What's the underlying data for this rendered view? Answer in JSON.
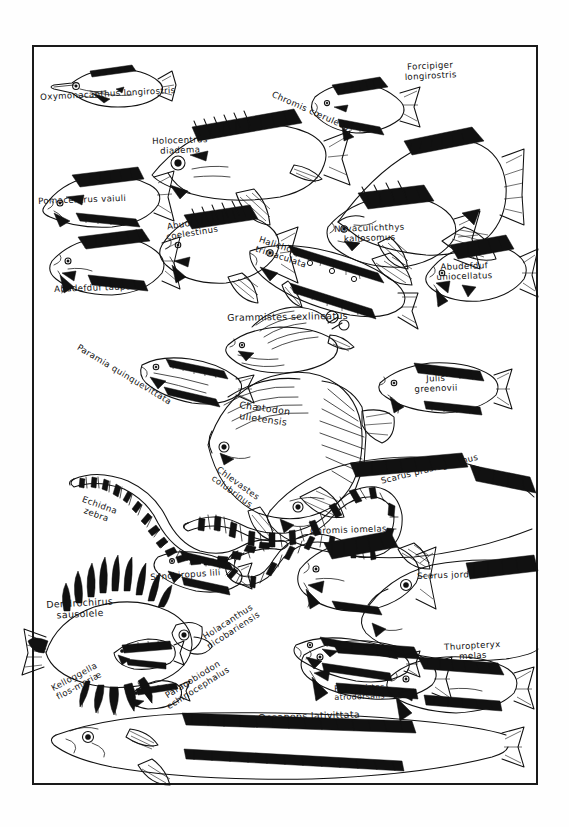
{
  "plate": {
    "title": "Handwritten fish identification plate",
    "style": "pen-and-ink line drawings of 25 reef fish with handwritten Latin binomial labels inside a single ruled rectangular frame",
    "frame": {
      "stroke_color": "#1a1a1a",
      "background": "#ffffff"
    },
    "ink_color": "#111111",
    "paper_color": "#fefefe"
  },
  "species": [
    {
      "id": 1,
      "label": "Oxymonacanthus longirostris",
      "lines": [
        "Oxymonacanthus longirostris"
      ],
      "x": 8,
      "y": 48,
      "rotate": -3,
      "size": "base",
      "icon": "filefish-icon"
    },
    {
      "id": 2,
      "label": "Chromis caeruleus",
      "lines": [
        "Chromis cœruleus"
      ],
      "x": 242,
      "y": 45,
      "rotate": 24,
      "size": "base",
      "icon": "damselfish-icon"
    },
    {
      "id": 3,
      "label": "Forcipiger longirostris",
      "lines": [
        "Forcipiger",
        "longirostris"
      ],
      "x": 372,
      "y": 18,
      "rotate": -3,
      "size": "base",
      "icon": "longnose-butterflyfish-icon"
    },
    {
      "id": 4,
      "label": "Holocentrus diadema",
      "lines": [
        "Holocentrus",
        "diadema"
      ],
      "x": 120,
      "y": 92,
      "rotate": -2,
      "size": "base",
      "icon": "squirrelfish-icon"
    },
    {
      "id": 5,
      "label": "Pomacentrus vaiuli",
      "lines": [
        "Pomacentrus vaiuli"
      ],
      "x": 6,
      "y": 152,
      "rotate": -2,
      "size": "base",
      "icon": "pomacentrus-icon"
    },
    {
      "id": 6,
      "label": "Abudefduf coelestinus",
      "lines": [
        "Abudefduf",
        "coelestinus"
      ],
      "x": 132,
      "y": 178,
      "rotate": -9,
      "size": "base",
      "icon": "sergeant-major-icon"
    },
    {
      "id": 7,
      "label": "Novaculichthys kallosomus",
      "lines": [
        "Novaculichthys",
        "kallosomus"
      ],
      "x": 302,
      "y": 180,
      "rotate": -2,
      "size": "base",
      "icon": "razorfish-icon"
    },
    {
      "id": 8,
      "label": "Halichoeres trimaculata",
      "lines": [
        "Halichœres",
        "trimaculata"
      ],
      "x": 228,
      "y": 190,
      "rotate": 18,
      "size": "base",
      "icon": "wrasse-icon"
    },
    {
      "id": 9,
      "label": "Abudefduf uniocellatus",
      "lines": [
        "Abudefduf",
        "uniocellatus"
      ],
      "x": 404,
      "y": 218,
      "rotate": -2,
      "size": "base",
      "icon": "damsel-uniocellatus-icon"
    },
    {
      "id": 10,
      "label": "Abudefduf taupo",
      "lines": [
        "Abudefduf taupo"
      ],
      "x": 22,
      "y": 240,
      "rotate": -2,
      "size": "base",
      "icon": "abudefduf-taupo-icon"
    },
    {
      "id": 11,
      "label": "Grammistes sexlineatus",
      "lines": [
        "Grammistes sexlineatus"
      ],
      "x": 195,
      "y": 268,
      "rotate": -1,
      "size": "lg",
      "icon": "soapfish-icon"
    },
    {
      "id": 12,
      "label": "Paramia quinquevittata",
      "lines": [
        "Paramia quinquevittata"
      ],
      "x": 48,
      "y": 298,
      "rotate": 31,
      "size": "base",
      "icon": "cardinalfish-icon"
    },
    {
      "id": 13,
      "label": "Julis greenovii",
      "lines": [
        "Julis",
        "greenovii"
      ],
      "x": 382,
      "y": 330,
      "rotate": -2,
      "size": "base",
      "icon": "julis-icon"
    },
    {
      "id": 14,
      "label": "Chaetodon ulietensis",
      "lines": [
        "Chætodon",
        "ulietensis"
      ],
      "x": 208,
      "y": 355,
      "rotate": 8,
      "size": "lg",
      "icon": "butterflyfish-icon"
    },
    {
      "id": 15,
      "label": "Chlevastes colubrinus",
      "lines": [
        "Chlevastes",
        "colubrinus"
      ],
      "x": 188,
      "y": 420,
      "rotate": 36,
      "size": "base",
      "icon": "sea-snake-eel-icon"
    },
    {
      "id": 16,
      "label": "Scarus prasiognathus",
      "lines": [
        "Scarus prasiognathus"
      ],
      "x": 348,
      "y": 432,
      "rotate": -14,
      "size": "base",
      "icon": "parrotfish-icon"
    },
    {
      "id": 17,
      "label": "Echidna zebra",
      "lines": [
        "Echidna",
        "zebra"
      ],
      "x": 52,
      "y": 450,
      "rotate": 20,
      "size": "base",
      "icon": "zebra-moray-icon"
    },
    {
      "id": 18,
      "label": "Chromis iomelas",
      "lines": [
        "Chromis iomelas"
      ],
      "x": 278,
      "y": 482,
      "rotate": -2,
      "size": "base",
      "icon": "chromis-iomelas-icon"
    },
    {
      "id": 19,
      "label": "Synchiropus lili",
      "lines": [
        "Synchiropus lili"
      ],
      "x": 118,
      "y": 528,
      "rotate": -4,
      "size": "base",
      "icon": "dragonet-icon"
    },
    {
      "id": 20,
      "label": "Scarus jordani",
      "lines": [
        "Scarus jordani"
      ],
      "x": 385,
      "y": 527,
      "rotate": -2,
      "size": "base",
      "icon": "scarus-jordani-icon"
    },
    {
      "id": 21,
      "label": "Dendrochirus sausolele",
      "lines": [
        "Dendrochirus",
        "sausolele"
      ],
      "x": 14,
      "y": 555,
      "rotate": -3,
      "size": "lg",
      "icon": "lionfish-icon"
    },
    {
      "id": 22,
      "label": "Holacanthus nicobariensis",
      "lines": [
        "Holacanthus",
        "nicobariensis"
      ],
      "x": 168,
      "y": 590,
      "rotate": -33,
      "size": "base",
      "icon": "angelfish-icon"
    },
    {
      "id": 23,
      "label": "Thuropteryx melas",
      "lines": [
        "Thuropteryx",
        "melas"
      ],
      "x": 412,
      "y": 598,
      "rotate": -3,
      "size": "base",
      "icon": "thuropteryx-icon"
    },
    {
      "id": 24,
      "label": "Petroscirtes atrodorsalis",
      "lines": [
        "Petroscirtes",
        "atrodorsalis"
      ],
      "x": 302,
      "y": 640,
      "rotate": -2,
      "size": "sm",
      "icon": "blenny-icon"
    },
    {
      "id": 25,
      "label": "Kelloggella flos-mariae",
      "lines": [
        "Kelloggella",
        "flos-mariæ"
      ],
      "x": 18,
      "y": 640,
      "rotate": -28,
      "size": "base",
      "icon": "goby-kelloggella-icon"
    },
    {
      "id": 26,
      "label": "Paragobiodon echinocephalus",
      "lines": [
        "Paragobiodon",
        "echinocephalus"
      ],
      "x": 128,
      "y": 650,
      "rotate": -32,
      "size": "base",
      "icon": "coral-goby-icon"
    },
    {
      "id": 27,
      "label": "Oceanops lativittata",
      "lines": [
        "Oceanops lativittata"
      ],
      "x": 226,
      "y": 668,
      "rotate": -2,
      "size": "lg",
      "icon": "neon-goby-icon"
    }
  ]
}
